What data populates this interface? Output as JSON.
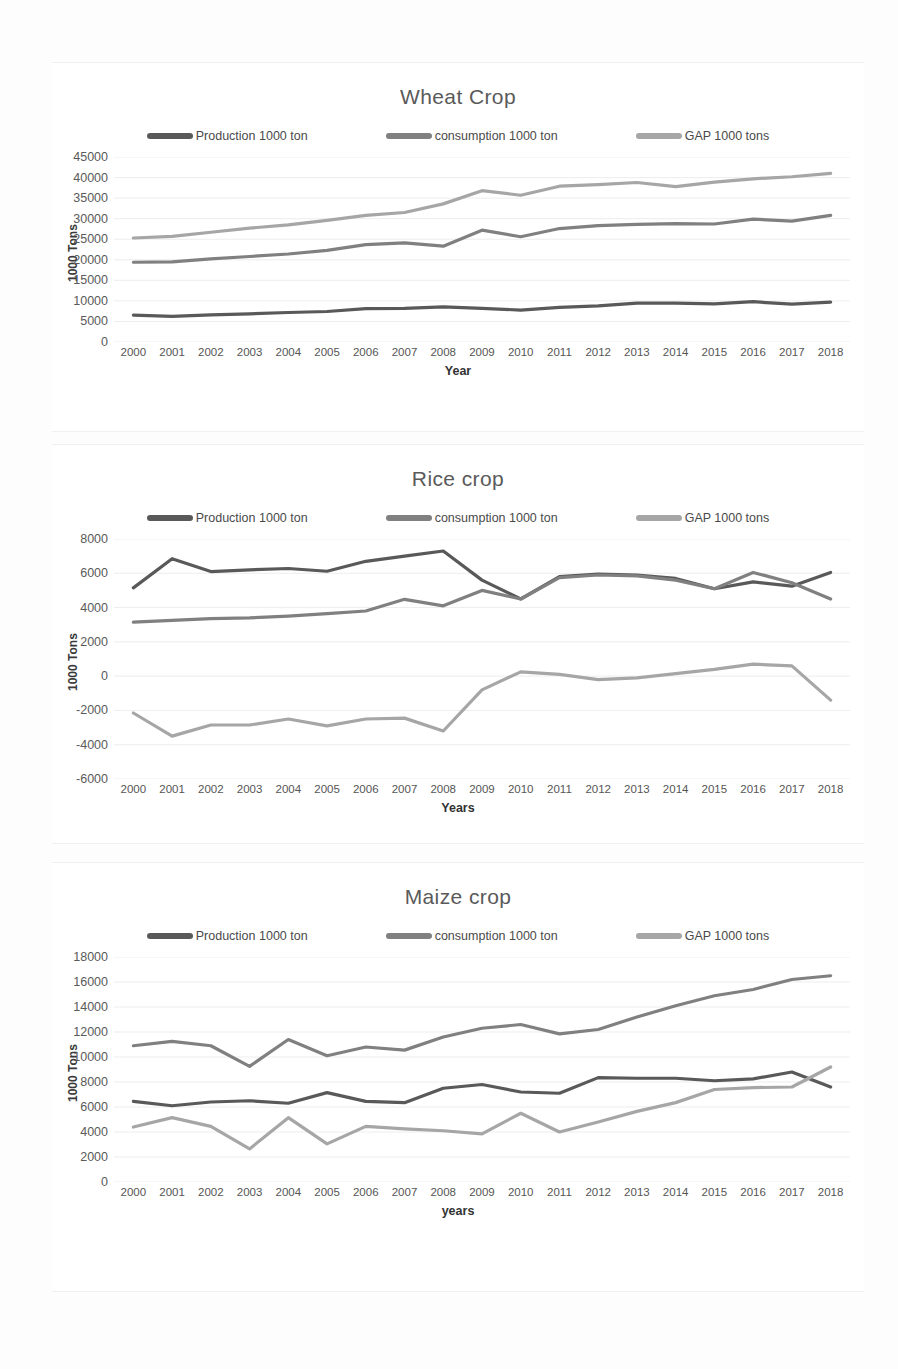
{
  "colors": {
    "production": "#595959",
    "consumption": "#808080",
    "gap": "#a6a6a6",
    "grid": "#e9e9e9",
    "text": "#4a4a4a"
  },
  "legend": {
    "production": "Production 1000 ton",
    "consumption": "consumption 1000 ton",
    "gap": "GAP 1000 tons"
  },
  "years": [
    "2000",
    "2001",
    "2002",
    "2003",
    "2004",
    "2005",
    "2006",
    "2007",
    "2008",
    "2009",
    "2010",
    "2011",
    "2012",
    "2013",
    "2014",
    "2015",
    "2016",
    "2017",
    "2018"
  ],
  "charts": [
    {
      "id": "wheat",
      "title": "Wheat Crop",
      "ylabel": "1000 Tons",
      "xlabel": "Year",
      "yticks": [
        "0",
        "5000",
        "10000",
        "15000",
        "20000",
        "25000",
        "30000",
        "35000",
        "40000",
        "45000"
      ]
    },
    {
      "id": "rice",
      "title": "Rice crop",
      "ylabel": "1000 Tons",
      "xlabel": "Years",
      "yticks": [
        "-6000",
        "-4000",
        "-2000",
        "0",
        "2000",
        "4000",
        "6000",
        "8000"
      ]
    },
    {
      "id": "maize",
      "title": "Maize crop",
      "ylabel": "1000 Tons",
      "xlabel": "years",
      "yticks": [
        "0",
        "2000",
        "4000",
        "6000",
        "8000",
        "10000",
        "12000",
        "14000",
        "16000",
        "18000"
      ]
    }
  ],
  "chart_data": [
    {
      "type": "line",
      "title": "Wheat Crop",
      "xlabel": "Year",
      "ylabel": "1000 Tons",
      "ylim": [
        0,
        45000
      ],
      "ytick_step": 5000,
      "grid": true,
      "legend_position": "top",
      "x": [
        "2000",
        "2001",
        "2002",
        "2003",
        "2004",
        "2005",
        "2006",
        "2007",
        "2008",
        "2009",
        "2010",
        "2011",
        "2012",
        "2013",
        "2014",
        "2015",
        "2016",
        "2017",
        "2018"
      ],
      "series": [
        {
          "name": "Production 1000 ton",
          "values": [
            6560,
            6250,
            6620,
            6840,
            7180,
            7420,
            8140,
            8200,
            8520,
            8200,
            7770,
            8400,
            8800,
            9460,
            9460,
            9280,
            9800,
            9200,
            9700
          ]
        },
        {
          "name": "consumption 1000 ton",
          "values": [
            19400,
            19500,
            20200,
            20800,
            21400,
            22300,
            23700,
            24100,
            23300,
            27200,
            25600,
            27600,
            28300,
            28600,
            28800,
            28700,
            29900,
            29400,
            30800
          ]
        },
        {
          "name": "GAP 1000 tons",
          "values": [
            25300,
            25700,
            26700,
            27700,
            28500,
            29600,
            30800,
            31500,
            33600,
            36800,
            35700,
            37900,
            38300,
            38800,
            37800,
            38900,
            39700,
            40200,
            41000
          ]
        }
      ]
    },
    {
      "type": "line",
      "title": "Rice crop",
      "xlabel": "Years",
      "ylabel": "1000 Tons",
      "ylim": [
        -6000,
        8000
      ],
      "ytick_step": 2000,
      "grid": true,
      "legend_position": "top",
      "x": [
        "2000",
        "2001",
        "2002",
        "2003",
        "2004",
        "2005",
        "2006",
        "2007",
        "2008",
        "2009",
        "2010",
        "2011",
        "2012",
        "2013",
        "2014",
        "2015",
        "2016",
        "2017",
        "2018"
      ],
      "series": [
        {
          "name": "Production 1000 ton",
          "values": [
            5150,
            6850,
            6100,
            6200,
            6280,
            6120,
            6700,
            7000,
            7300,
            5600,
            4500,
            5800,
            5950,
            5900,
            5700,
            5100,
            5500,
            5250,
            6050
          ]
        },
        {
          "name": "consumption 1000 ton",
          "values": [
            3150,
            3250,
            3350,
            3400,
            3500,
            3650,
            3800,
            4480,
            4100,
            5000,
            4500,
            5750,
            5900,
            5850,
            5600,
            5100,
            6050,
            5450,
            4500
          ]
        },
        {
          "name": "GAP 1000 tons",
          "values": [
            -2150,
            -3500,
            -2850,
            -2850,
            -2500,
            -2900,
            -2500,
            -2450,
            -3200,
            -800,
            250,
            100,
            -200,
            -100,
            150,
            400,
            700,
            600,
            -1400
          ]
        }
      ]
    },
    {
      "type": "line",
      "title": "Maize crop",
      "xlabel": "years",
      "ylabel": "1000 Tons",
      "ylim": [
        0,
        18000
      ],
      "ytick_step": 2000,
      "grid": true,
      "legend_position": "top",
      "x": [
        "2000",
        "2001",
        "2002",
        "2003",
        "2004",
        "2005",
        "2006",
        "2007",
        "2008",
        "2009",
        "2010",
        "2011",
        "2012",
        "2013",
        "2014",
        "2015",
        "2016",
        "2017",
        "2018"
      ],
      "series": [
        {
          "name": "Production 1000 ton",
          "values": [
            6450,
            6100,
            6400,
            6500,
            6300,
            7150,
            6450,
            6350,
            7500,
            7800,
            7200,
            7100,
            8350,
            8300,
            8300,
            8100,
            8250,
            8800,
            7600
          ]
        },
        {
          "name": "consumption 1000 ton",
          "values": [
            10900,
            11250,
            10900,
            9250,
            11400,
            10100,
            10800,
            10550,
            11600,
            12300,
            12600,
            11850,
            12200,
            13200,
            14100,
            14900,
            15400,
            16200,
            16500
          ]
        },
        {
          "name": "GAP 1000 tons",
          "values": [
            4400,
            5150,
            4450,
            2650,
            5150,
            3050,
            4450,
            4250,
            4100,
            3850,
            5500,
            4000,
            4800,
            5650,
            6350,
            7400,
            7550,
            7600,
            9200
          ]
        }
      ]
    }
  ]
}
